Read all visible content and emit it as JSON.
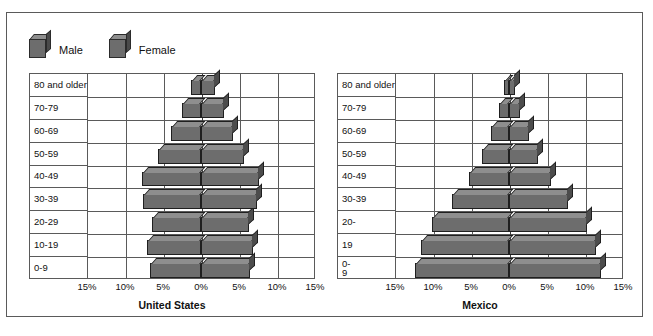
{
  "legend": {
    "items": [
      {
        "label": "Male",
        "icon": "cube-icon",
        "color": "#6d6d6d"
      },
      {
        "label": "Female",
        "icon": "cube-icon",
        "color": "#6d6d6d"
      }
    ]
  },
  "colors": {
    "bar_face": "#6d6d6d",
    "bar_top": "#8e8e8e",
    "bar_side": "#4c4c4c",
    "grid": "#5a5a5a",
    "frame": "#5a5a5a",
    "background": "#ffffff"
  },
  "charts": [
    {
      "id": "united-states",
      "title": "United States",
      "age_labels": [
        "80 and older",
        "70-79",
        "60-69",
        "50-59",
        "40-49",
        "30-39",
        "20-29",
        "10-19",
        "0-9"
      ],
      "axis_ticks": [
        "15%",
        "10%",
        "5%",
        "0%",
        "5%",
        "10%",
        "15%"
      ]
    },
    {
      "id": "mexico",
      "title": "Mexico",
      "age_labels": [
        "80 and older",
        "70-79",
        "60-69",
        "50-59",
        "40-49",
        "30-39",
        "20-",
        "19",
        "0-",
        "9"
      ],
      "axis_ticks": [
        "15%",
        "10%",
        "5%",
        "0%",
        "5%",
        "10%",
        "15%"
      ]
    }
  ],
  "chart_data": [
    {
      "type": "bar",
      "title": "United States",
      "subtitle": "Population pyramid",
      "orientation": "horizontal-diverging",
      "xlabel": "",
      "ylabel": "",
      "xlim": [
        -15,
        15
      ],
      "xtick_values": [
        -15,
        -10,
        -5,
        0,
        5,
        10,
        15
      ],
      "xtick_labels": [
        "15%",
        "10%",
        "5%",
        "0%",
        "5%",
        "10%",
        "15%"
      ],
      "grid": true,
      "legend_position": "top-left",
      "categories": [
        "0-9",
        "10-19",
        "20-29",
        "30-39",
        "40-49",
        "50-59",
        "60-69",
        "70-79",
        "80 and older"
      ],
      "series": [
        {
          "name": "Male",
          "side": "left",
          "values": [
            6.7,
            7.1,
            6.5,
            7.6,
            7.7,
            5.6,
            3.9,
            2.5,
            1.3
          ]
        },
        {
          "name": "Female",
          "side": "right",
          "values": [
            6.4,
            6.8,
            6.3,
            7.4,
            7.6,
            5.7,
            4.2,
            3.0,
            1.9
          ]
        }
      ]
    },
    {
      "type": "bar",
      "title": "Mexico",
      "subtitle": "Population pyramid",
      "orientation": "horizontal-diverging",
      "xlabel": "",
      "ylabel": "",
      "xlim": [
        -15,
        15
      ],
      "xtick_values": [
        -15,
        -10,
        -5,
        0,
        5,
        10,
        15
      ],
      "xtick_labels": [
        "15%",
        "10%",
        "5%",
        "0%",
        "5%",
        "10%",
        "15%"
      ],
      "grid": true,
      "legend_position": "top-left",
      "categories": [
        "0-9",
        "10-19",
        "20-29",
        "30-39",
        "40-49",
        "50-59",
        "60-69",
        "70-79",
        "80 and older"
      ],
      "series": [
        {
          "name": "Male",
          "side": "left",
          "values": [
            12.4,
            11.6,
            10.1,
            7.5,
            5.3,
            3.6,
            2.4,
            1.3,
            0.6
          ]
        },
        {
          "name": "Female",
          "side": "right",
          "values": [
            12.1,
            11.4,
            10.2,
            7.7,
            5.5,
            3.8,
            2.6,
            1.5,
            0.8
          ]
        }
      ]
    }
  ]
}
